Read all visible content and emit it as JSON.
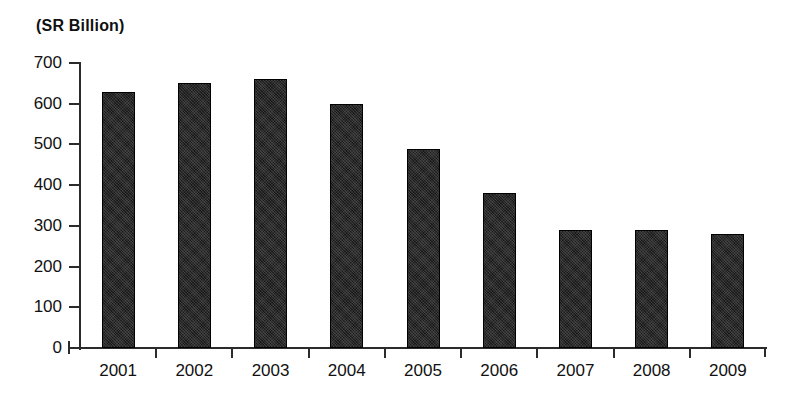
{
  "chart_data": {
    "type": "bar",
    "title": "(SR Billion)",
    "xlabel": "",
    "ylabel": "",
    "ylim": [
      0,
      700
    ],
    "ytick_step": 100,
    "grid": false,
    "legend": false,
    "bar_color": "#1a1a1a",
    "axis_color": "#2b2b2b",
    "background_color": "#ffffff",
    "categories": [
      "2001",
      "2002",
      "2003",
      "2004",
      "2005",
      "2006",
      "2007",
      "2008",
      "2009"
    ],
    "values": [
      630,
      650,
      660,
      600,
      490,
      380,
      290,
      290,
      280
    ],
    "ytick_labels": [
      "700",
      "600",
      "500",
      "400",
      "300",
      "200",
      "100",
      "0"
    ],
    "ytick_values": [
      700,
      600,
      500,
      400,
      300,
      200,
      100,
      0
    ]
  }
}
